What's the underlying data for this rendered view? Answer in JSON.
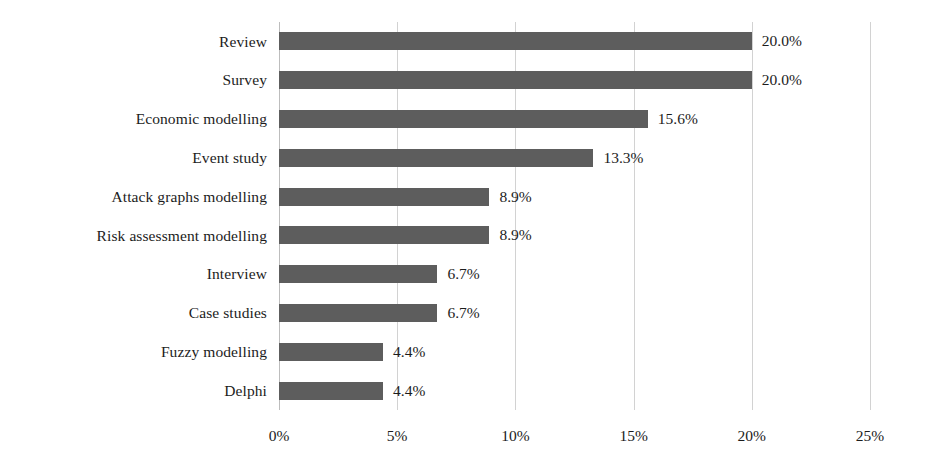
{
  "chart_data": {
    "type": "bar",
    "orientation": "horizontal",
    "title": "",
    "subtitle": "",
    "xlabel": "",
    "ylabel": "",
    "categories": [
      "Review",
      "Survey",
      "Economic modelling",
      "Event study",
      "Attack graphs modelling",
      "Risk assessment modelling",
      "Interview",
      "Case studies",
      "Fuzzy modelling",
      "Delphi"
    ],
    "values": [
      20.0,
      20.0,
      15.6,
      13.3,
      8.9,
      8.9,
      6.7,
      6.7,
      4.4,
      4.4
    ],
    "data_labels": [
      "20.0%",
      "20.0%",
      "15.6%",
      "13.3%",
      "8.9%",
      "8.9%",
      "6.7%",
      "6.7%",
      "4.4%",
      "4.4%"
    ],
    "xlim": [
      0,
      25
    ],
    "xticks": [
      0,
      5,
      10,
      15,
      20,
      25
    ],
    "xtick_labels": [
      "0%",
      "5%",
      "10%",
      "15%",
      "20%",
      "25%"
    ],
    "grid": true,
    "grid_axis": "x",
    "legend": false,
    "legend_position": "none",
    "bar_color": "#5d5d5d",
    "gridline_color": "#d2d2d2",
    "text_color": "#1c1c1c",
    "background_color": "#ffffff"
  }
}
